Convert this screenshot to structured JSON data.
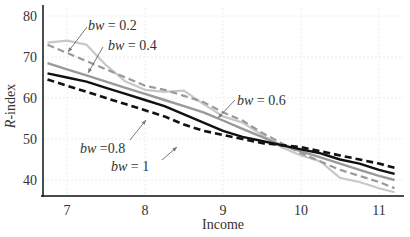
{
  "chart_data": {
    "type": "line",
    "title": "",
    "xlabel": "Income",
    "ylabel": "R-index",
    "xlim": [
      6.7,
      11.25
    ],
    "ylim": [
      36,
      81
    ],
    "xticks": [
      7,
      8,
      9,
      10,
      11
    ],
    "yticks": [
      40,
      50,
      60,
      70,
      80
    ],
    "grid": true,
    "x": [
      6.75,
      7.0,
      7.25,
      7.5,
      7.75,
      8.0,
      8.25,
      8.5,
      8.75,
      9.0,
      9.25,
      9.5,
      9.75,
      10.0,
      10.25,
      10.5,
      10.75,
      11.0,
      11.2
    ],
    "series": [
      {
        "name": "bw = 0.2",
        "color": "#c8c8c8",
        "style": "solid",
        "values": [
          73.5,
          74,
          73,
          68,
          64,
          62,
          61.5,
          61.8,
          58.5,
          55.5,
          54,
          51,
          48,
          46,
          44.5,
          40.5,
          39.5,
          38,
          37
        ]
      },
      {
        "name": "bw = 0.4",
        "color": "#9a9a9a",
        "style": "dashed",
        "values": [
          73,
          71,
          69,
          67,
          65,
          63,
          62,
          60.5,
          59,
          56.5,
          54.5,
          51.5,
          49,
          46.5,
          44.5,
          42.5,
          41,
          39.5,
          38
        ]
      },
      {
        "name": "bw = 0.6",
        "color": "#999999",
        "style": "solid",
        "values": [
          68.5,
          67,
          65.5,
          64,
          62.5,
          61,
          59.5,
          58,
          56.5,
          54.5,
          52.5,
          50.5,
          48.5,
          47,
          45.5,
          44,
          42.5,
          41,
          40
        ]
      },
      {
        "name": "bw =0.8",
        "color": "#111111",
        "style": "solid",
        "values": [
          66,
          65,
          64,
          62.5,
          61,
          59.5,
          58,
          56,
          54,
          52,
          50.5,
          49.5,
          48.5,
          47.5,
          46.5,
          45,
          44,
          42.5,
          41.5
        ]
      },
      {
        "name": "bw = 1",
        "color": "#111111",
        "style": "dashed",
        "values": [
          64.5,
          63,
          61.5,
          60,
          58.5,
          57,
          55.5,
          53.5,
          52,
          51,
          50,
          49,
          48.5,
          48,
          47,
          46,
          45,
          44,
          43
        ]
      }
    ],
    "annotations": [
      {
        "text_prefix": "bw",
        "text_suffix": " = 0.2",
        "target_series": "bw = 0.2"
      },
      {
        "text_prefix": "bw",
        "text_suffix": " = 0.4",
        "target_series": "bw = 0.4"
      },
      {
        "text_prefix": "bw",
        "text_suffix": " = 0.6",
        "target_series": "bw = 0.6"
      },
      {
        "text_prefix": "bw",
        "text_suffix": " =0.8",
        "target_series": "bw =0.8"
      },
      {
        "text_prefix": "bw",
        "text_suffix": " = 1",
        "target_series": "bw = 1"
      }
    ]
  }
}
